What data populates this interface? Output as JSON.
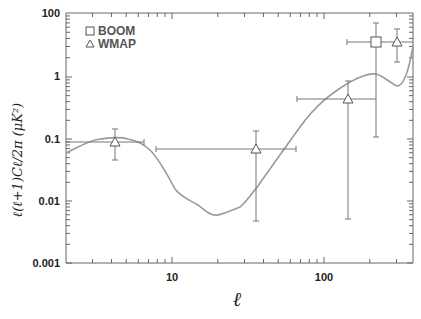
{
  "chart_data": {
    "type": "scatter",
    "title": "",
    "xlabel": "ℓ",
    "ylabel": "ℓ(ℓ+1)Cℓ/2π (μK²)",
    "xscale": "log",
    "yscale": "log",
    "xlim": [
      2,
      385
    ],
    "ylim": [
      0.001,
      100
    ],
    "x_ticks": [
      "10",
      "100"
    ],
    "y_ticks": [
      "100",
      "1",
      "0.1",
      "0.01",
      "0.001"
    ],
    "grid": false,
    "legend": {
      "position": "upper left",
      "entries": [
        {
          "label": "BOOM",
          "marker": "square"
        },
        {
          "label": "WMAP",
          "marker": "triangle"
        }
      ]
    },
    "series": [
      {
        "name": "BOOM",
        "marker": "square",
        "points": [
          {
            "x": 220,
            "y": 3.4,
            "x_err": [
              140,
              385
            ],
            "y_err": [
              0.1,
              7.0
            ]
          }
        ]
      },
      {
        "name": "WMAP",
        "marker": "triangle",
        "points": [
          {
            "x": 4.2,
            "y": 0.09,
            "x_err": [
              2,
              6.5
            ],
            "y_err": [
              0.045,
              0.14
            ]
          },
          {
            "x": 36,
            "y": 0.069,
            "x_err": [
              7.8,
              65
            ],
            "y_err": [
              0.005,
              0.13
            ]
          },
          {
            "x": 145,
            "y": 0.42,
            "x_err": [
              66,
              220
            ],
            "y_err": [
              0.005,
              0.8
            ]
          },
          {
            "x": 300,
            "y": 3.4,
            "x_err": [
              300,
              300
            ],
            "y_err": [
              1.7,
              6.0
            ]
          }
        ]
      },
      {
        "name": "model curve",
        "type": "line",
        "points": [
          {
            "x": 2,
            "y": 0.055
          },
          {
            "x": 3,
            "y": 0.085
          },
          {
            "x": 4.2,
            "y": 0.1
          },
          {
            "x": 5.5,
            "y": 0.09
          },
          {
            "x": 7,
            "y": 0.065
          },
          {
            "x": 9,
            "y": 0.035
          },
          {
            "x": 11,
            "y": 0.016
          },
          {
            "x": 13,
            "y": 0.011
          },
          {
            "x": 17,
            "y": 0.008
          },
          {
            "x": 20,
            "y": 0.0058
          },
          {
            "x": 25,
            "y": 0.0067
          },
          {
            "x": 30,
            "y": 0.0085
          },
          {
            "x": 40,
            "y": 0.022
          },
          {
            "x": 60,
            "y": 0.07
          },
          {
            "x": 100,
            "y": 0.28
          },
          {
            "x": 150,
            "y": 0.6
          },
          {
            "x": 200,
            "y": 0.95
          },
          {
            "x": 230,
            "y": 1.0
          },
          {
            "x": 260,
            "y": 0.85
          },
          {
            "x": 300,
            "y": 0.62
          },
          {
            "x": 330,
            "y": 0.75
          },
          {
            "x": 385,
            "y": 3.0
          }
        ]
      }
    ]
  },
  "axes": {
    "x_tick_labels": [
      "10",
      "100"
    ],
    "y_tick_labels": [
      "100",
      "1",
      "0.1",
      "0.01",
      "0.001"
    ],
    "xlabel": "ℓ",
    "ylabel": "ℓ(ℓ+1)Cℓ/2π (μK²)"
  },
  "legend": {
    "boom": "BOOM",
    "wmap": "WMAP"
  },
  "colors": {
    "axis": "#555555",
    "curve": "#999999",
    "errorbar": "#777777"
  }
}
